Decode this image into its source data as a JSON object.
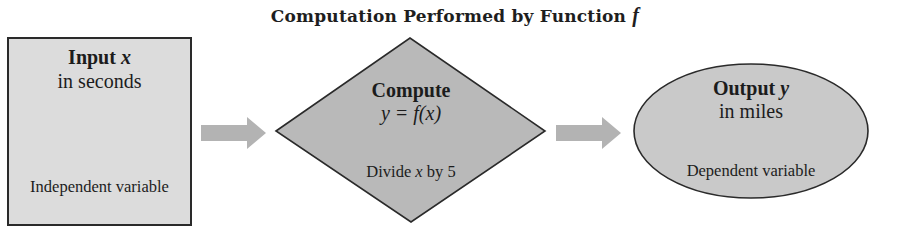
{
  "title": {
    "prefix": "Computation Performed by Function ",
    "function_symbol": "f"
  },
  "nodes": {
    "input": {
      "shape": "rectangle",
      "heading_prefix": "Input ",
      "heading_var": "x",
      "unit": "in seconds",
      "role": "Independent variable",
      "fill": "#dcdcdc"
    },
    "compute": {
      "shape": "diamond",
      "heading": "Compute",
      "formula": "y = f(x)",
      "rule_prefix": "Divide ",
      "rule_var": "x",
      "rule_suffix": " by 5",
      "fill": "#b9b9b9"
    },
    "output": {
      "shape": "ellipse",
      "heading_prefix": "Output ",
      "heading_var": "y",
      "unit": "in miles",
      "role": "Dependent variable",
      "fill": "#c9c9c9"
    }
  },
  "edges": [
    {
      "from": "input",
      "to": "compute",
      "color": "#b3b3b3"
    },
    {
      "from": "compute",
      "to": "output",
      "color": "#b3b3b3"
    }
  ]
}
